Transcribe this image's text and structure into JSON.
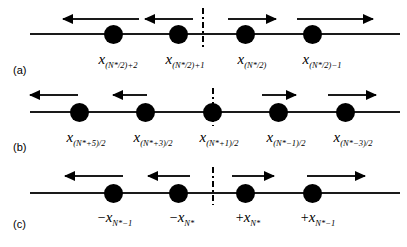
{
  "figure": {
    "caption_tags": [
      "(a)",
      "(b)",
      "(c)"
    ],
    "background_color": "#ffffff",
    "line_color": "#1a1a1a",
    "dot_color": "#000000",
    "symmetry_line_style": "dash-dot"
  },
  "panels": [
    {
      "tag": "(a)",
      "tag_x": 13,
      "tag_y": 64,
      "axis": {
        "x": 30,
        "y": 33,
        "width": 370
      },
      "symmetry_line": {
        "x": 202,
        "y": 8,
        "height": 40
      },
      "dots": [
        {
          "cx": 113,
          "cy": 34
        },
        {
          "cx": 178,
          "cy": 34
        },
        {
          "cx": 245,
          "cy": 34
        },
        {
          "cx": 312,
          "cy": 34
        }
      ],
      "arrows": [
        {
          "direction": "left",
          "x": 63,
          "y": 14,
          "width": 76
        },
        {
          "direction": "left",
          "x": 145,
          "y": 14,
          "width": 48
        },
        {
          "direction": "right",
          "x": 228,
          "y": 14,
          "width": 48
        },
        {
          "direction": "right",
          "x": 297,
          "y": 14,
          "width": 76
        }
      ],
      "labels": [
        {
          "cx": 118,
          "y": 52,
          "sign": "",
          "symbol": "x",
          "subscript": "(N*/2)+2"
        },
        {
          "cx": 185,
          "y": 52,
          "sign": "",
          "symbol": "x",
          "subscript": "(N*/2)+1"
        },
        {
          "cx": 252,
          "y": 52,
          "sign": "",
          "symbol": "x",
          "subscript": "(N*/2)"
        },
        {
          "cx": 322,
          "y": 52,
          "sign": "",
          "symbol": "x",
          "subscript": "(N*/2)−1"
        }
      ]
    },
    {
      "tag": "(b)",
      "tag_x": 13,
      "tag_y": 141,
      "axis": {
        "x": 30,
        "y": 111,
        "width": 370
      },
      "symmetry_line": {
        "x": 212,
        "y": 88,
        "height": 38
      },
      "dots": [
        {
          "cx": 79,
          "cy": 112
        },
        {
          "cx": 145,
          "cy": 112
        },
        {
          "cx": 212,
          "cy": 112
        },
        {
          "cx": 278,
          "cy": 112
        },
        {
          "cx": 345,
          "cy": 112
        }
      ],
      "arrows": [
        {
          "direction": "left",
          "x": 30,
          "y": 90,
          "width": 48
        },
        {
          "direction": "left",
          "x": 113,
          "y": 90,
          "width": 34
        },
        {
          "direction": "right",
          "x": 262,
          "y": 90,
          "width": 34
        },
        {
          "direction": "right",
          "x": 328,
          "y": 90,
          "width": 48
        }
      ],
      "labels": [
        {
          "cx": 86,
          "y": 130,
          "sign": "",
          "symbol": "x",
          "subscript": "(N*+5)/2"
        },
        {
          "cx": 153,
          "y": 130,
          "sign": "",
          "symbol": "x",
          "subscript": "(N*+3)/2"
        },
        {
          "cx": 219,
          "y": 130,
          "sign": "",
          "symbol": "x",
          "subscript": "(N*+1)/2"
        },
        {
          "cx": 286,
          "y": 130,
          "sign": "",
          "symbol": "x",
          "subscript": "(N*−1)/2"
        },
        {
          "cx": 353,
          "y": 130,
          "sign": "",
          "symbol": "x",
          "subscript": "(N*−3)/2"
        }
      ]
    },
    {
      "tag": "(c)",
      "tag_x": 13,
      "tag_y": 218,
      "axis": {
        "x": 30,
        "y": 192,
        "width": 370
      },
      "symmetry_line": {
        "x": 212,
        "y": 167,
        "height": 38
      },
      "dots": [
        {
          "cx": 113,
          "cy": 193
        },
        {
          "cx": 178,
          "cy": 193
        },
        {
          "cx": 245,
          "cy": 193
        },
        {
          "cx": 312,
          "cy": 193
        }
      ],
      "arrows": [
        {
          "direction": "left",
          "x": 65,
          "y": 171,
          "width": 58
        },
        {
          "direction": "left",
          "x": 148,
          "y": 171,
          "width": 42
        },
        {
          "direction": "right",
          "x": 232,
          "y": 171,
          "width": 42
        },
        {
          "direction": "right",
          "x": 307,
          "y": 171,
          "width": 58
        }
      ],
      "labels": [
        {
          "cx": 115,
          "y": 210,
          "sign": "−",
          "symbol": "x",
          "subscript": "N*−1"
        },
        {
          "cx": 182,
          "y": 210,
          "sign": "−",
          "symbol": "x",
          "subscript": "N*"
        },
        {
          "cx": 248,
          "y": 210,
          "sign": "+",
          "symbol": "x",
          "subscript": "N*"
        },
        {
          "cx": 318,
          "y": 210,
          "sign": "+",
          "symbol": "x",
          "subscript": "N*−1"
        }
      ]
    }
  ]
}
